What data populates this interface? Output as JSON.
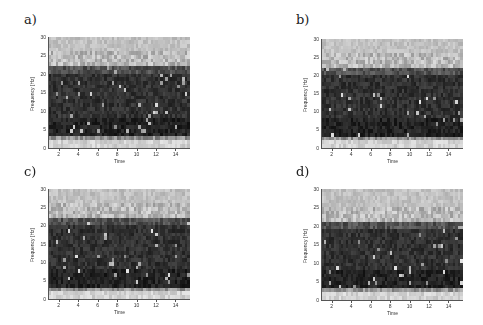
{
  "chart_data": [
    {
      "type": "heatmap",
      "panel_label": "a)",
      "xlabel": "Time",
      "ylabel": "Frequency [Hz]",
      "xlim": [
        1,
        15.5
      ],
      "ylim": [
        0,
        30
      ],
      "xticks": [
        2,
        4,
        6,
        8,
        10,
        12,
        14
      ],
      "yticks": [
        0,
        5,
        10,
        15,
        20,
        25,
        30
      ],
      "colormap": "gray",
      "band_profile": {
        "dark_low_hz": 3,
        "dark_high_hz": 22,
        "light_top_hz": 30,
        "light_bottom_hz": 2
      },
      "box": {
        "left": 49,
        "top": 37,
        "width": 141,
        "height": 111
      },
      "seed": 11
    },
    {
      "type": "heatmap",
      "panel_label": "b)",
      "xlabel": "Time",
      "ylabel": "Frequency [Hz]",
      "xlim": [
        1,
        15.5
      ],
      "ylim": [
        0,
        30
      ],
      "xticks": [
        2,
        4,
        6,
        8,
        10,
        12,
        14
      ],
      "yticks": [
        0,
        5,
        10,
        15,
        20,
        25,
        30
      ],
      "colormap": "gray",
      "band_profile": {
        "dark_low_hz": 3,
        "dark_high_hz": 22,
        "light_top_hz": 30,
        "light_bottom_hz": 2
      },
      "box": {
        "left": 322,
        "top": 39,
        "width": 141,
        "height": 109
      },
      "seed": 23
    },
    {
      "type": "heatmap",
      "panel_label": "c)",
      "xlabel": "Time",
      "ylabel": "Frequency [Hz]",
      "xlim": [
        1,
        15.5
      ],
      "ylim": [
        0,
        30
      ],
      "xticks": [
        2,
        4,
        6,
        8,
        10,
        12,
        14
      ],
      "yticks": [
        0,
        5,
        10,
        15,
        20,
        25,
        30
      ],
      "colormap": "gray",
      "band_profile": {
        "dark_low_hz": 3,
        "dark_high_hz": 22,
        "light_top_hz": 30,
        "light_bottom_hz": 2
      },
      "box": {
        "left": 49,
        "top": 189,
        "width": 141,
        "height": 110
      },
      "seed": 37
    },
    {
      "type": "heatmap",
      "panel_label": "d)",
      "xlabel": "Time",
      "ylabel": "Frequency [Hz]",
      "xlim": [
        1,
        15.5
      ],
      "ylim": [
        0,
        30
      ],
      "xticks": [
        2,
        4,
        6,
        8,
        10,
        12,
        14
      ],
      "yticks": [
        0,
        5,
        10,
        15,
        20,
        25,
        30
      ],
      "colormap": "gray",
      "band_profile": {
        "dark_low_hz": 3,
        "dark_high_hz": 21,
        "light_top_hz": 30,
        "light_bottom_hz": 2
      },
      "box": {
        "left": 322,
        "top": 189,
        "width": 141,
        "height": 111
      },
      "seed": 53
    }
  ],
  "panels": [
    {
      "label": "a)",
      "label_pos": {
        "left": 24,
        "top": 12
      }
    },
    {
      "label": "b)",
      "label_pos": {
        "left": 296,
        "top": 12
      }
    },
    {
      "label": "c)",
      "label_pos": {
        "left": 24,
        "top": 164
      }
    },
    {
      "label": "d)",
      "label_pos": {
        "left": 296,
        "top": 164
      }
    }
  ]
}
